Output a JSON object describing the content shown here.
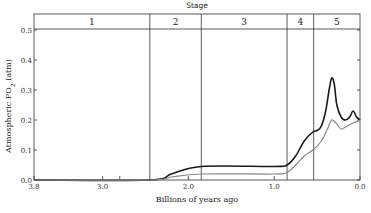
{
  "chart_data": {
    "type": "line",
    "title": "",
    "stage_header": "Stage",
    "xlabel": "Billions of years ago",
    "ylabel": "Atmospheric PO2 (atm)",
    "xlim": [
      3.8,
      0.0
    ],
    "ylim": [
      0.0,
      0.5
    ],
    "x_ticks": [
      "3.8",
      "3.0",
      "2.0",
      "1.0",
      "0.0"
    ],
    "y_ticks": [
      "0.0",
      "0.1",
      "0.2",
      "0.3",
      "0.4",
      "0.5"
    ],
    "grid": false,
    "stages": [
      {
        "label": "1",
        "from": 3.85,
        "to": 2.45
      },
      {
        "label": "2",
        "from": 2.45,
        "to": 1.85
      },
      {
        "label": "3",
        "from": 1.85,
        "to": 0.85
      },
      {
        "label": "4",
        "from": 0.85,
        "to": 0.54
      },
      {
        "label": "5",
        "from": 0.54,
        "to": 0.0
      }
    ],
    "series": [
      {
        "name": "upper estimate",
        "color": "#1a1a1a",
        "x": [
          3.8,
          2.45,
          2.2,
          1.85,
          1.0,
          0.85,
          0.75,
          0.65,
          0.55,
          0.5,
          0.45,
          0.4,
          0.36,
          0.33,
          0.3,
          0.27,
          0.22,
          0.17,
          0.12,
          0.08,
          0.04,
          0.0
        ],
        "y": [
          0.0,
          0.0,
          0.02,
          0.045,
          0.045,
          0.05,
          0.08,
          0.13,
          0.16,
          0.165,
          0.18,
          0.23,
          0.3,
          0.34,
          0.32,
          0.25,
          0.21,
          0.2,
          0.21,
          0.23,
          0.21,
          0.2
        ]
      },
      {
        "name": "lower estimate",
        "color": "#888888",
        "x": [
          3.8,
          2.45,
          2.2,
          1.85,
          1.0,
          0.85,
          0.75,
          0.65,
          0.55,
          0.45,
          0.38,
          0.33,
          0.28,
          0.22,
          0.15,
          0.08,
          0.0
        ],
        "y": [
          0.0,
          0.0,
          0.01,
          0.02,
          0.02,
          0.025,
          0.05,
          0.08,
          0.1,
          0.13,
          0.17,
          0.2,
          0.19,
          0.17,
          0.18,
          0.19,
          0.2
        ]
      }
    ]
  }
}
